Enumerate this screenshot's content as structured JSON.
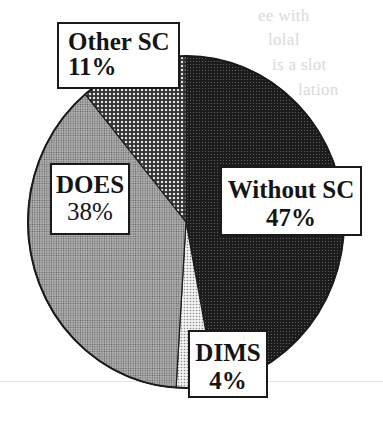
{
  "chart_data": {
    "type": "pie",
    "title": "",
    "start_angle_deg": 0,
    "direction": "clockwise",
    "slices": [
      {
        "label": "Without SC",
        "value": 47,
        "display": "47%",
        "pattern": "dark-dots",
        "color": "#2a2a2a"
      },
      {
        "label": "DIMS",
        "value": 4,
        "display": "4%",
        "pattern": "light-dots",
        "color": "#d8d8d8"
      },
      {
        "label": "DOES",
        "value": 38,
        "display": "38%",
        "pattern": "medium-fine-dots",
        "color": "#8c8c8c"
      },
      {
        "label": "Other SC",
        "value": 11,
        "display": "11%",
        "pattern": "coarse-dots",
        "color": "#5c5c5c"
      }
    ],
    "categories": [
      "Without SC",
      "DIMS",
      "DOES",
      "Other SC"
    ],
    "values": [
      47,
      4,
      38,
      11
    ],
    "legend": "none (labels placed on slices in boxes)"
  },
  "labels": {
    "other_sc": {
      "name": "Other SC",
      "pct": "11%"
    },
    "does": {
      "name": "DOES",
      "pct": "38%"
    },
    "without_sc": {
      "name": "Without SC",
      "pct": "47%"
    },
    "dims": {
      "name": "DIMS",
      "pct": "4%"
    }
  },
  "background_bleedthrough": [
    "ee with",
    "lolal",
    "is a slot",
    "lation"
  ]
}
